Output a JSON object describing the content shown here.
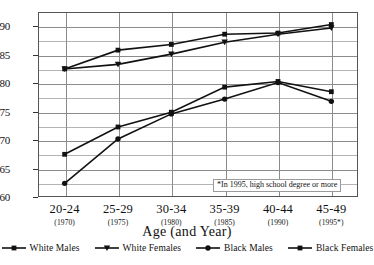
{
  "chart_data": {
    "type": "line",
    "title": "",
    "xlabel": "Age (and Year)",
    "ylabel": "",
    "categories": [
      "20-24",
      "25-29",
      "30-34",
      "35-39",
      "40-44",
      "45-49"
    ],
    "category_sublabels": [
      "(1970)",
      "(1975)",
      "(1980)",
      "(1985)",
      "(1990)",
      "(1995*)"
    ],
    "ylim": [
      0.6,
      0.925
    ],
    "yticks": [
      0.6,
      0.65,
      0.7,
      0.75,
      0.8,
      0.85,
      0.9
    ],
    "ytick_labels": [
      "0.60",
      "0.65",
      "0.70",
      "0.75",
      "0.80",
      "0.85",
      "0.90"
    ],
    "minor_ytick_step": 0.025,
    "grid": true,
    "legend_position": "bottom",
    "annotation": "*In 1995, high school degree or more",
    "series": [
      {
        "name": "White Males",
        "marker": "square",
        "color": "#111111",
        "values": [
          0.825,
          0.858,
          0.868,
          0.886,
          0.888,
          0.903
        ]
      },
      {
        "name": "White Females",
        "marker": "triangle-down",
        "color": "#111111",
        "values": [
          0.825,
          0.833,
          0.851,
          0.872,
          0.886,
          0.897
        ]
      },
      {
        "name": "Black Males",
        "marker": "circle",
        "color": "#111111",
        "values": [
          0.624,
          0.702,
          0.746,
          0.772,
          0.801,
          0.768
        ]
      },
      {
        "name": "Black Females",
        "marker": "square",
        "color": "#111111",
        "values": [
          0.675,
          0.723,
          0.749,
          0.793,
          0.803,
          0.785
        ]
      }
    ]
  },
  "legend": {
    "items": [
      {
        "label": "White Males",
        "marker": "square"
      },
      {
        "label": "White Females",
        "marker": "triangle-down"
      },
      {
        "label": "Black Males",
        "marker": "circle"
      },
      {
        "label": "Black Females",
        "marker": "square"
      }
    ]
  }
}
